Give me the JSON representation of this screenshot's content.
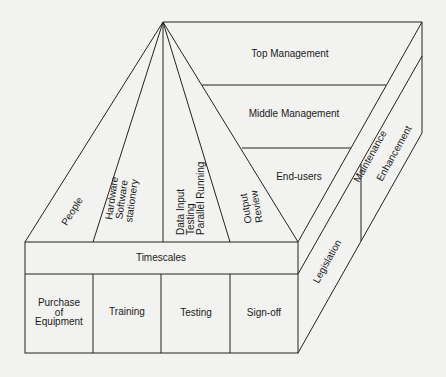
{
  "diagram": {
    "apex_labels": {
      "people": "People",
      "hardware": [
        "Hardware",
        "Software",
        "stationery"
      ],
      "data": [
        "Data Input",
        "Testing",
        "Parallel Running"
      ],
      "output": [
        "Output",
        "Review"
      ]
    },
    "levels": {
      "top": "Top Management",
      "middle": "Middle Management",
      "end": "End-users"
    },
    "side_bands": {
      "maintenance": "Maintenance",
      "enhancement": "Enhancement",
      "legislation": "Legislation"
    },
    "front": {
      "header": "Timescales",
      "cells": {
        "purchase": [
          "Purchase",
          "of",
          "Equipment"
        ],
        "training": "Training",
        "testing": "Testing",
        "signoff": "Sign-off"
      }
    },
    "colors": {
      "line": "#222222",
      "background": "#f2f2f0",
      "text": "#1a1a1a"
    }
  }
}
